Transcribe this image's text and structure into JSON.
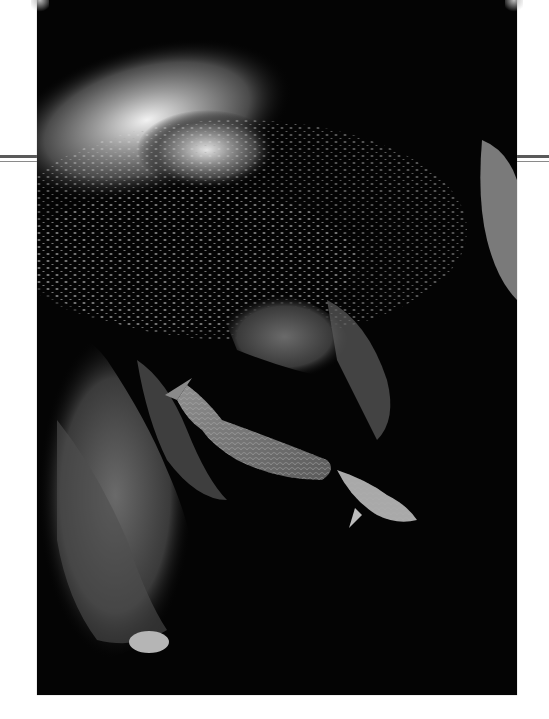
{
  "page": {
    "background": "#ffffff",
    "rule_color": "#5a5a5a"
  },
  "photo": {
    "subject": "underwater reef scene",
    "elements": [
      "school-of-small-fish",
      "parrotfish-large",
      "parrotfish-small",
      "reef-rock"
    ],
    "tone": "grayscale",
    "caption": ""
  }
}
